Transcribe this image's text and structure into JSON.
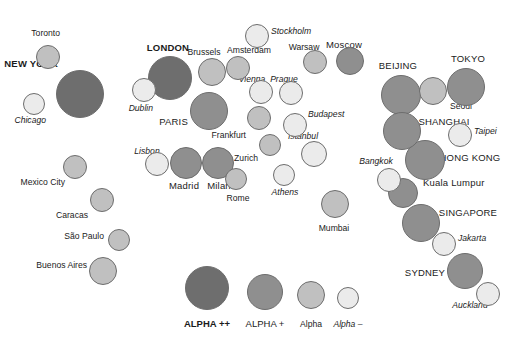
{
  "figure": {
    "width": 518,
    "height": 338,
    "background": "#ffffff"
  },
  "tiers": {
    "alpha_pp": {
      "key": "ALPHA ++",
      "fill": "#6e6e6e",
      "radius": 24,
      "label_style": "bold-caps"
    },
    "alpha_p": {
      "key": "ALPHA +",
      "fill": "#8f8f8f",
      "radius": 20,
      "label_style": "caps"
    },
    "alpha": {
      "key": "Alpha",
      "fill": "#c0c0c0",
      "radius": 14,
      "label_style": "normal"
    },
    "alpha_m": {
      "key": "Alpha -",
      "fill": "#ebebeb",
      "radius": 12,
      "label_style": "italic"
    },
    "stroke": "#6d6d6d"
  },
  "chart_data": {
    "type": "scatter",
    "xlabel": "",
    "ylabel": "",
    "legend_position": "bottom-center",
    "grid": false,
    "size_encodes": "alpha tier rank",
    "color_encodes": "alpha tier rank",
    "categories": [
      "ALPHA ++",
      "ALPHA +",
      "Alpha",
      "Alpha -"
    ],
    "points": [
      {
        "name": "Toronto",
        "tier": "alpha",
        "cx": 48,
        "cy": 57,
        "r": 12,
        "lx": 60,
        "ly": 33,
        "anchor": "end"
      },
      {
        "name": "NEW YORK",
        "tier": "alpha_pp",
        "cx": 80,
        "cy": 94,
        "r": 24,
        "lx": 58,
        "ly": 64,
        "anchor": "end"
      },
      {
        "name": "Chicago",
        "tier": "alpha_m",
        "cx": 34,
        "cy": 104,
        "r": 11,
        "lx": 46,
        "ly": 120,
        "anchor": "end"
      },
      {
        "name": "Mexico City",
        "tier": "alpha",
        "cx": 75,
        "cy": 167,
        "r": 12,
        "lx": 65,
        "ly": 182,
        "anchor": "end"
      },
      {
        "name": "Caracas",
        "tier": "alpha",
        "cx": 102,
        "cy": 200,
        "r": 12,
        "lx": 88,
        "ly": 215,
        "anchor": "end"
      },
      {
        "name": "São Paulo",
        "tier": "alpha",
        "cx": 119,
        "cy": 240,
        "r": 11,
        "lx": 104,
        "ly": 236,
        "anchor": "end"
      },
      {
        "name": "Buenos Aires",
        "tier": "alpha",
        "cx": 103,
        "cy": 271,
        "r": 14,
        "lx": 87,
        "ly": 265,
        "anchor": "end"
      },
      {
        "name": "LONDON",
        "tier": "alpha_pp",
        "cx": 170,
        "cy": 78,
        "r": 22,
        "lx": 168,
        "ly": 48,
        "anchor": "middle"
      },
      {
        "name": "Dublin",
        "tier": "alpha_m",
        "cx": 144,
        "cy": 90,
        "r": 12,
        "lx": 153,
        "ly": 108,
        "anchor": "end"
      },
      {
        "name": "PARIS",
        "tier": "alpha_p",
        "cx": 209,
        "cy": 111,
        "r": 19,
        "lx": 188,
        "ly": 122,
        "anchor": "end"
      },
      {
        "name": "Brussels",
        "tier": "alpha",
        "cx": 212,
        "cy": 72,
        "r": 14,
        "lx": 204,
        "ly": 52,
        "anchor": "middle"
      },
      {
        "name": "Amsterdam",
        "tier": "alpha",
        "cx": 238,
        "cy": 68,
        "r": 12,
        "lx": 249,
        "ly": 50,
        "anchor": "middle"
      },
      {
        "name": "Stockholm",
        "tier": "alpha_m",
        "cx": 257,
        "cy": 36,
        "r": 12,
        "lx": 271,
        "ly": 31,
        "anchor": "start"
      },
      {
        "name": "Warsaw",
        "tier": "alpha",
        "cx": 315,
        "cy": 62,
        "r": 12,
        "lx": 304,
        "ly": 47,
        "anchor": "middle"
      },
      {
        "name": "Moscow",
        "tier": "alpha_p",
        "cx": 350,
        "cy": 61,
        "r": 14,
        "lx": 344,
        "ly": 45,
        "anchor": "middle"
      },
      {
        "name": "Vienna",
        "tier": "alpha_m",
        "cx": 261,
        "cy": 92,
        "r": 12,
        "lx": 252,
        "ly": 79,
        "anchor": "middle"
      },
      {
        "name": "Prague",
        "tier": "alpha_m",
        "cx": 291,
        "cy": 93,
        "r": 12,
        "lx": 284,
        "ly": 79,
        "anchor": "middle"
      },
      {
        "name": "Frankfurt",
        "tier": "alpha",
        "cx": 259,
        "cy": 118,
        "r": 12,
        "lx": 246,
        "ly": 135,
        "anchor": "end"
      },
      {
        "name": "Budapest",
        "tier": "alpha_m",
        "cx": 295,
        "cy": 125,
        "r": 12,
        "lx": 308,
        "ly": 114,
        "anchor": "start"
      },
      {
        "name": "Istanbul",
        "tier": "alpha_m",
        "cx": 314,
        "cy": 154,
        "r": 13,
        "lx": 303,
        "ly": 136,
        "anchor": "middle"
      },
      {
        "name": "Zurich",
        "tier": "alpha",
        "cx": 270,
        "cy": 145,
        "r": 11,
        "lx": 258,
        "ly": 158,
        "anchor": "end"
      },
      {
        "name": "Lisbon",
        "tier": "alpha_m",
        "cx": 157,
        "cy": 164,
        "r": 12,
        "lx": 147,
        "ly": 151,
        "anchor": "middle"
      },
      {
        "name": "Madrid",
        "tier": "alpha_p",
        "cx": 186,
        "cy": 163,
        "r": 16,
        "lx": 184,
        "ly": 186,
        "anchor": "middle"
      },
      {
        "name": "Milan",
        "tier": "alpha_p",
        "cx": 218,
        "cy": 163,
        "r": 16,
        "lx": 219,
        "ly": 186,
        "anchor": "middle"
      },
      {
        "name": "Rome",
        "tier": "alpha",
        "cx": 236,
        "cy": 179,
        "r": 11,
        "lx": 238,
        "ly": 198,
        "anchor": "middle"
      },
      {
        "name": "Athens",
        "tier": "alpha_m",
        "cx": 284,
        "cy": 175,
        "r": 11,
        "lx": 285,
        "ly": 192,
        "anchor": "middle"
      },
      {
        "name": "Mumbai",
        "tier": "alpha",
        "cx": 335,
        "cy": 204,
        "r": 14,
        "lx": 334,
        "ly": 228,
        "anchor": "middle"
      },
      {
        "name": "Bangkok",
        "tier": "alpha_m",
        "cx": 389,
        "cy": 180,
        "r": 12,
        "lx": 376,
        "ly": 161,
        "anchor": "middle"
      },
      {
        "name": "BEIJING",
        "tier": "alpha_p",
        "cx": 401,
        "cy": 95,
        "r": 20,
        "lx": 398,
        "ly": 66,
        "anchor": "middle"
      },
      {
        "name": "Seoul",
        "tier": "alpha",
        "cx": 433,
        "cy": 91,
        "r": 14,
        "lx": 450,
        "ly": 106,
        "anchor": "start"
      },
      {
        "name": "TOKYO",
        "tier": "alpha_p",
        "cx": 466,
        "cy": 87,
        "r": 19,
        "lx": 468,
        "ly": 59,
        "anchor": "middle"
      },
      {
        "name": "SHANGHAI",
        "tier": "alpha_p",
        "cx": 402,
        "cy": 131,
        "r": 19,
        "lx": 444,
        "ly": 122,
        "anchor": "middle"
      },
      {
        "name": "Taipei",
        "tier": "alpha_m",
        "cx": 460,
        "cy": 135,
        "r": 12,
        "lx": 474,
        "ly": 131,
        "anchor": "start"
      },
      {
        "name": "HONG KONG",
        "tier": "alpha_p",
        "cx": 425,
        "cy": 160,
        "r": 20,
        "lx": 470,
        "ly": 158,
        "anchor": "middle"
      },
      {
        "name": "Kuala Lumpur",
        "tier": "alpha_p",
        "cx": 403,
        "cy": 193,
        "r": 15,
        "lx": 423,
        "ly": 183,
        "anchor": "start"
      },
      {
        "name": "SINGAPORE",
        "tier": "alpha_p",
        "cx": 421,
        "cy": 223,
        "r": 19,
        "lx": 468,
        "ly": 213,
        "anchor": "middle"
      },
      {
        "name": "Jakarta",
        "tier": "alpha_m",
        "cx": 444,
        "cy": 244,
        "r": 12,
        "lx": 458,
        "ly": 238,
        "anchor": "start"
      },
      {
        "name": "SYDNEY",
        "tier": "alpha_p",
        "cx": 465,
        "cy": 271,
        "r": 18,
        "lx": 425,
        "ly": 273,
        "anchor": "middle"
      },
      {
        "name": "Auckland",
        "tier": "alpha_m",
        "cx": 488,
        "cy": 294,
        "r": 12,
        "lx": 470,
        "ly": 305,
        "anchor": "middle"
      }
    ]
  },
  "legend": {
    "items": [
      {
        "label": "ALPHA ++",
        "tier": "alpha_pp",
        "cx": 207,
        "cy": 288,
        "r": 22,
        "lx": 207,
        "ly": 324
      },
      {
        "label": "ALPHA +",
        "tier": "alpha_p",
        "cx": 265,
        "cy": 292,
        "r": 18,
        "lx": 265,
        "ly": 324
      },
      {
        "label": "Alpha",
        "tier": "alpha",
        "cx": 311,
        "cy": 295,
        "r": 14,
        "lx": 311,
        "ly": 324
      },
      {
        "label": "Alpha –",
        "tier": "alpha_m",
        "cx": 348,
        "cy": 298,
        "r": 11,
        "lx": 348,
        "ly": 324
      }
    ]
  }
}
